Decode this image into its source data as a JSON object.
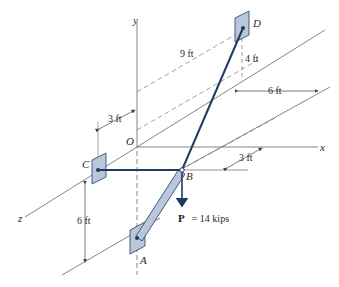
{
  "diagram": {
    "axes": {
      "x": "x",
      "y": "y",
      "z": "z",
      "origin": "O"
    },
    "points": {
      "A": "A",
      "B": "B",
      "C": "C",
      "D": "D"
    },
    "dimensions": {
      "d_9ft": "9 ft",
      "d_4ft": "4 ft",
      "d_6ft_top": "6 ft",
      "d_3ft_left": "3 ft",
      "d_3ft_right": "3 ft",
      "d_6ft_left": "6 ft"
    },
    "load": {
      "symbol": "P",
      "value": "= 14 kips"
    },
    "colors": {
      "member": "#1f3a66",
      "support_fill": "#b8c8da",
      "support_stroke": "#1f3a66",
      "strut_fill": "#b8c8da",
      "axis": "#555555",
      "dim": "#555555"
    }
  }
}
